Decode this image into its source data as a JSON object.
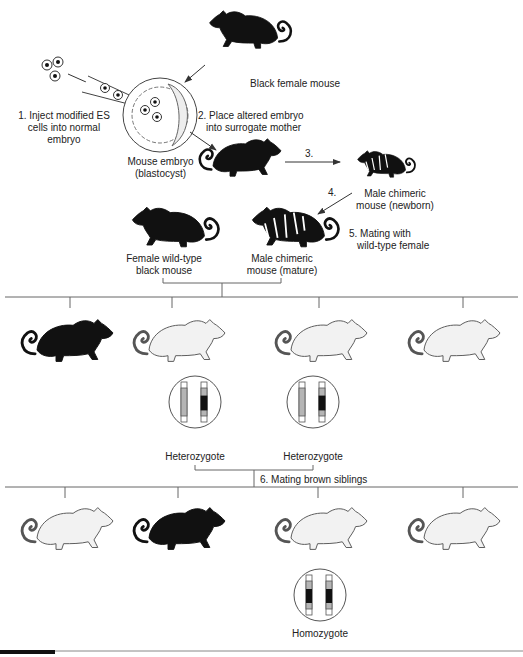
{
  "diagram": {
    "colors": {
      "black_mouse": "#111111",
      "light_mouse_fill": "#f2f2f2",
      "light_mouse_shade": "#dcdcdc",
      "outline": "#555555",
      "line": "#666666",
      "chromosome_gray": "#b5b5b5",
      "chromosome_black": "#111111",
      "bottom_bar": "#111111"
    },
    "steps": {
      "step1": "1. Inject modified ES cells into normal embryo",
      "step1_lines": [
        "1. Inject modified ES",
        "cells into normal",
        "embryo"
      ],
      "step2_lines": [
        "2. Place altered embryo",
        "into surrogate mother"
      ],
      "step3": "3.",
      "step4": "4.",
      "step5_lines": [
        "5. Mating with",
        "wild-type female"
      ],
      "step6": "6. Mating brown siblings"
    },
    "labels": {
      "black_female": "Black female mouse",
      "embryo_lines": [
        "Mouse embryo",
        "(blastocyst)"
      ],
      "chimeric_newborn_lines": [
        "Male chimeric",
        "mouse (newborn)"
      ],
      "female_wildtype_lines": [
        "Female wild-type",
        "black mouse"
      ],
      "chimeric_mature_lines": [
        "Male chimeric",
        "mouse (mature)"
      ],
      "heterozygote_1": "Heterozygote",
      "heterozygote_2": "Heterozygote",
      "homozygote": "Homozygote"
    },
    "generations": {
      "f1": [
        {
          "color": "black"
        },
        {
          "color": "brown",
          "genotype": "Heterozygote"
        },
        {
          "color": "brown",
          "genotype": "Heterozygote"
        },
        {
          "color": "brown"
        }
      ],
      "f2": [
        {
          "color": "brown"
        },
        {
          "color": "black"
        },
        {
          "color": "brown",
          "genotype": "Homozygote"
        },
        {
          "color": "brown"
        }
      ]
    }
  }
}
